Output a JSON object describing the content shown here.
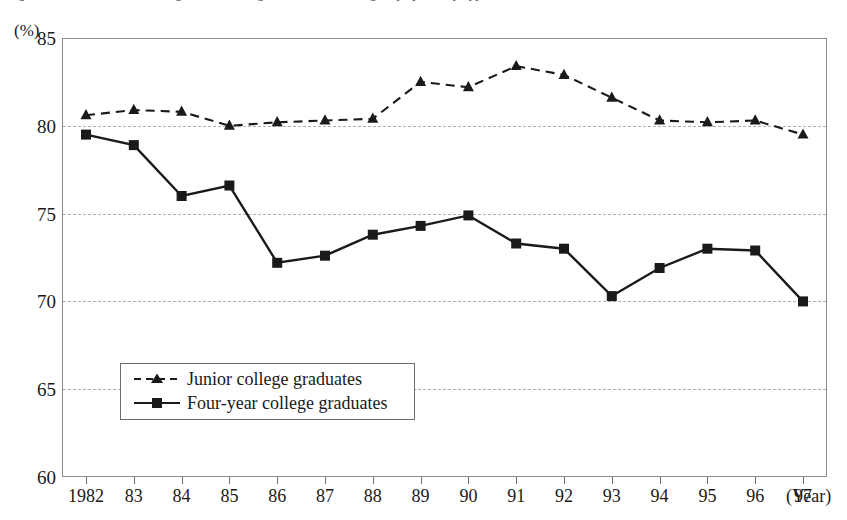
{
  "figure": {
    "caption": "Figure 3-2   Trends in the Percentage of New College Graduates Obtaining Employment by Type of Institution"
  },
  "axes": {
    "y_unit_label": "(%)",
    "y_ticks": [
      "85",
      "80",
      "75",
      "70",
      "65",
      "60"
    ],
    "x_axis_title": "(Year)",
    "x_tick_labels": [
      "1982",
      "83",
      "84",
      "85",
      "86",
      "87",
      "88",
      "89",
      "90",
      "91",
      "92",
      "93",
      "94",
      "95",
      "96",
      "97"
    ]
  },
  "legend": {
    "items": [
      {
        "label": "Junior college graduates",
        "style": "dashed-triangle",
        "color": "#1a1a1a"
      },
      {
        "label": "Four-year college graduates",
        "style": "solid-square",
        "color": "#1a1a1a"
      }
    ]
  },
  "chart_data": {
    "type": "line",
    "title": "Trends in the Percentage of New College Graduates Obtaining Employment by Type of Institution",
    "xlabel": "(Year)",
    "ylabel": "(%)",
    "ylim": [
      60,
      85
    ],
    "y_ticks": [
      60,
      65,
      70,
      75,
      80,
      85
    ],
    "grid": true,
    "legend_position": "inside-lower-left",
    "categories": [
      "1982",
      "83",
      "84",
      "85",
      "86",
      "87",
      "88",
      "89",
      "90",
      "91",
      "92",
      "93",
      "94",
      "95",
      "96",
      "97"
    ],
    "x": [
      1982,
      1983,
      1984,
      1985,
      1986,
      1987,
      1988,
      1989,
      1990,
      1991,
      1992,
      1993,
      1994,
      1995,
      1996,
      1997
    ],
    "series": [
      {
        "name": "Junior college graduates",
        "marker": "triangle",
        "line": "dashed",
        "color": "#1a1a1a",
        "values": [
          80.6,
          80.9,
          80.8,
          80.0,
          80.2,
          80.3,
          80.4,
          82.5,
          82.2,
          83.4,
          82.9,
          81.6,
          80.3,
          80.2,
          80.3,
          79.5
        ]
      },
      {
        "name": "Four-year college graduates",
        "marker": "square",
        "line": "solid",
        "color": "#1a1a1a",
        "values": [
          79.5,
          78.9,
          76.0,
          76.6,
          72.2,
          72.6,
          73.8,
          74.3,
          74.9,
          73.3,
          73.0,
          70.3,
          71.9,
          73.0,
          72.9,
          70.0
        ]
      }
    ]
  }
}
